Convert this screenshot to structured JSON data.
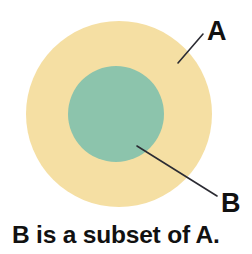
{
  "figure": {
    "background_color": "#FFFFFF",
    "caption": "B is a subset of A."
  },
  "sets": {
    "outer": {
      "label": "A",
      "name": "set-a",
      "fill_color": "#F5DFA3",
      "center_x": 119,
      "center_y": 114,
      "radius": 93
    },
    "inner": {
      "label": "B",
      "name": "set-b",
      "fill_color": "#8CC4AC",
      "center_x": 116,
      "center_y": 114,
      "radius": 48
    }
  },
  "annotations": {
    "label_a": {
      "text": "A",
      "x": 207,
      "y": 40,
      "leader": {
        "x1": 203,
        "y1": 34,
        "x2": 178,
        "y2": 63
      },
      "line_color": "#2B2B33"
    },
    "label_b": {
      "text": "B",
      "x": 221,
      "y": 212,
      "leader": {
        "x1": 217,
        "y1": 196,
        "x2": 137,
        "y2": 146
      },
      "line_color": "#2B2B33"
    }
  },
  "caption": {
    "text": "B is a subset of A.",
    "x": 12,
    "y": 243,
    "color": "#111111"
  }
}
